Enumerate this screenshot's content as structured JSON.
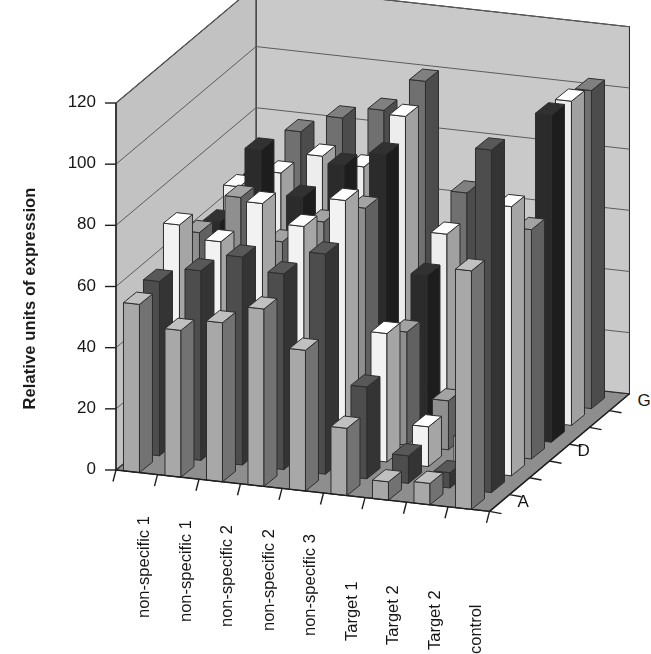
{
  "chart_data": {
    "type": "bar",
    "subtype": "3d-grouped-bar",
    "title": "",
    "subtitle": "",
    "xlabel": "",
    "ylabel": "Relative units of expression",
    "zlabel": "",
    "ylim": [
      0,
      120
    ],
    "yticks": [
      0,
      20,
      40,
      60,
      80,
      100,
      120
    ],
    "grid": true,
    "legend": "none",
    "categories": [
      "non-specific 1",
      "non-specific 1",
      "non-specific 2",
      "non-specific 2",
      "non-specific 3",
      "Target 1",
      "Target 2",
      "Target 2",
      "control"
    ],
    "depth_axis": {
      "labels": [
        "A",
        "D",
        "G"
      ],
      "label_positions": [
        0,
        3,
        6
      ],
      "tick_count": 7,
      "series_names": [
        "A",
        "B",
        "C",
        "D",
        "E",
        "F",
        "G"
      ]
    },
    "series": [
      {
        "name": "A",
        "color": "#a8a8a8",
        "values": [
          55,
          48,
          52,
          58,
          46,
          22,
          6,
          7,
          78
        ]
      },
      {
        "name": "B",
        "color": "#4d4d4d",
        "values": [
          57,
          62,
          68,
          64,
          72,
          30,
          9,
          5,
          112
        ]
      },
      {
        "name": "C",
        "color": "#f2f2f2",
        "values": [
          70,
          66,
          80,
          74,
          84,
          42,
          13,
          11,
          88
        ]
      },
      {
        "name": "D",
        "color": "#8f8f8f",
        "values": [
          62,
          75,
          62,
          70,
          76,
          37,
          16,
          14,
          75
        ]
      },
      {
        "name": "E",
        "color": "#2b2b2b",
        "values": [
          60,
          85,
          71,
          83,
          88,
          50,
          12,
          20,
          107
        ]
      },
      {
        "name": "F",
        "color": "#ededed",
        "values": [
          66,
          72,
          79,
          77,
          95,
          58,
          24,
          27,
          106
        ]
      },
      {
        "name": "G",
        "color": "#707070",
        "values": [
          64,
          80,
          86,
          90,
          101,
          66,
          33,
          31,
          104
        ]
      }
    ],
    "palette": {
      "wall_back": "#c9c9c9",
      "wall_side": "#c2c2c2",
      "floor": "#8e8e8e",
      "gridline": "#5c5c5c",
      "outline": "#2e2e2e",
      "axis_line": "#1f1f1f",
      "background": "#ffffff",
      "text": "#161616"
    }
  },
  "axis_labels": {
    "y_title": "Relative units of expression"
  }
}
